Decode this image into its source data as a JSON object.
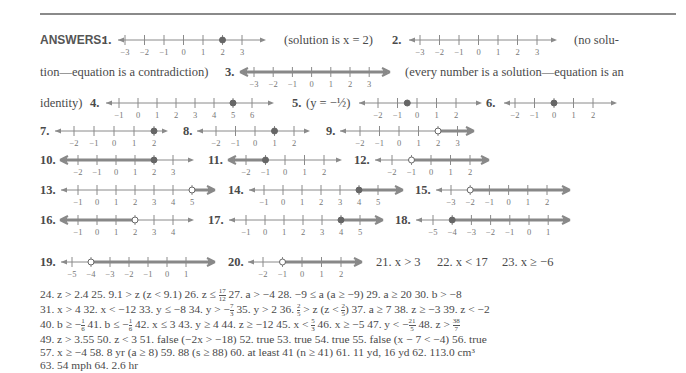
{
  "header": {
    "label": "ANSWERS:"
  },
  "colors": {
    "text": "#4a4a4a",
    "axis": "#8a8a8a",
    "shade": "#888888",
    "point": "#666666"
  },
  "prose": {
    "a1": "(solution is x = 2)",
    "a2_start": "(no solu-",
    "a2_end": "tion—equation is a contradiction)",
    "a3_start": "(every number is a solution—equation is an",
    "a3_end": "identity)",
    "a5": "(y = −½)"
  },
  "number_lines": [
    {
      "n": "1.",
      "ticks": [
        -3,
        -2,
        -1,
        0,
        1,
        2,
        3
      ],
      "point": 2,
      "closed": true,
      "shade": "none"
    },
    {
      "n": "2.",
      "ticks": [
        -3,
        -2,
        -1,
        0,
        1,
        2,
        3
      ],
      "point": null,
      "closed": false,
      "shade": "none"
    },
    {
      "n": "3.",
      "ticks": [
        -3,
        -2,
        -1,
        0,
        1,
        2,
        3
      ],
      "point": null,
      "closed": false,
      "shade": "all"
    },
    {
      "n": "4.",
      "ticks": [
        -1,
        0,
        1,
        2,
        3,
        4,
        5,
        6
      ],
      "point": 5,
      "closed": true,
      "shade": "none"
    },
    {
      "n": "5.",
      "ticks": [
        -2,
        -1,
        0,
        1,
        2
      ],
      "point": -0.5,
      "closed": true,
      "shade": "none"
    },
    {
      "n": "6.",
      "ticks": [
        -2,
        -1,
        0,
        1,
        2
      ],
      "point": 0,
      "closed": true,
      "shade": "none"
    },
    {
      "n": "7.",
      "ticks": [
        -2,
        -1,
        0,
        1,
        2
      ],
      "point": 2,
      "closed": true,
      "shade": "none"
    },
    {
      "n": "8.",
      "ticks": [
        -2,
        -1,
        0,
        1,
        2
      ],
      "point": 1,
      "closed": true,
      "shade": "none"
    },
    {
      "n": "9.",
      "ticks": [
        -2,
        -1,
        0,
        1,
        2,
        3
      ],
      "point": 2,
      "closed": false,
      "shade": "right"
    },
    {
      "n": "10.",
      "ticks": [
        -2,
        -1,
        0,
        1,
        2,
        3
      ],
      "point": 2,
      "closed": true,
      "shade": "left"
    },
    {
      "n": "11.",
      "ticks": [
        -2,
        -1,
        0,
        1,
        2
      ],
      "point": -1,
      "closed": true,
      "shade": "left"
    },
    {
      "n": "12.",
      "ticks": [
        -2,
        -1,
        0,
        1,
        2
      ],
      "point": -1,
      "closed": false,
      "shade": "right"
    },
    {
      "n": "13.",
      "ticks": [
        -1,
        0,
        1,
        2,
        3,
        4,
        5
      ],
      "point": 5,
      "closed": false,
      "shade": "right"
    },
    {
      "n": "14.",
      "ticks": [
        -1,
        0,
        1,
        2,
        3,
        4,
        5
      ],
      "point": 4,
      "closed": true,
      "shade": "right"
    },
    {
      "n": "15.",
      "ticks": [
        -3,
        -2,
        -1,
        0,
        1,
        2
      ],
      "point": -2,
      "closed": false,
      "shade": "right"
    },
    {
      "n": "16.",
      "ticks": [
        -1,
        0,
        1,
        2,
        3,
        4
      ],
      "point": 2,
      "closed": false,
      "shade": "left"
    },
    {
      "n": "17.",
      "ticks": [
        -1,
        0,
        1,
        2,
        3,
        4,
        5
      ],
      "point": 4,
      "closed": true,
      "shade": "right"
    },
    {
      "n": "18.",
      "ticks": [
        -5,
        -4,
        -3,
        -2,
        -1,
        0,
        1
      ],
      "point": -4,
      "closed": true,
      "shade": "right"
    },
    {
      "n": "19.",
      "ticks": [
        -5,
        -4,
        -3,
        -2,
        -1,
        0,
        1
      ],
      "point": -4,
      "closed": false,
      "shade": "right"
    },
    {
      "n": "20.",
      "ticks": [
        -2,
        -1,
        0,
        1,
        2
      ],
      "point": -1,
      "closed": false,
      "shade": "right"
    }
  ],
  "inline_answers_row": {
    "a21": "21. x > 3",
    "a22": "22. x < 17",
    "a23": "23. x ≥ −6"
  },
  "answer_lines": [
    "24. z > 2.4   25. 9.1 > z (z < 9.1)   26. z ≤ 17/12   27. a > −4   28. −9 ≤ a (a ≥ −9)   29. a ≥ 20   30. b > −8",
    "31. x > 4   32. x < −12   33. y ≤ −8   34. y > −7/3   35. y > 2   36. 2/5 > z (z < 2/5)   37. a ≥ 7   38. z ≥ −3   39. z < −2",
    "40. b ≥ −1/6   41. b ≤ −1/6   42. x ≤ 3   43. y ≥ 4   44. z ≥ −12   45. x < 5/3   46. x ≥ −5   47. y < −21/5   48. z > 38/7",
    "49. z > 3.55   50. z < 3   51. false (−2x > −18)   52. true   53. true   54. true   55. false (x − 7 < −4)   56. true",
    "57. x ≥ −4   58. 8 yr (a ≥ 8)   59. 88 (s ≥ 88)   60. at least 41 (n ≥ 41)   61. 11 yd, 16 yd   62. 113.0 cm³",
    "63. 54 mph   64. 2.6 hr"
  ],
  "answer_segments": {
    "l24": [
      "24. ",
      "z > 2.4",
      "25. ",
      "9.1 > z (z < 9.1)",
      "26. ",
      "z ≤ ",
      "17",
      "12",
      "27. ",
      "a > −4",
      "28. ",
      "−9 ≤ a (a ≥ −9)",
      "29. ",
      "a ≥ 20",
      "30. ",
      "b > −8"
    ],
    "l31_pre": "31. x > 4   32. x < −12   33. y ≤ −8   34. y > −",
    "l31_f1": [
      "7",
      "3"
    ],
    "l31_mid": "   35. y > 2   36. ",
    "l31_f2": [
      "2",
      "5"
    ],
    "l31_mid2": " > z (z < ",
    "l31_f3": [
      "2",
      "5"
    ],
    "l31_post": ")   37. a ≥ 7   38. z ≥ −3   39. z < −2",
    "l40_a": "40. b ≥ −",
    "l40_f1": [
      "1",
      "6"
    ],
    "l40_b": "   41. b ≤ −",
    "l40_f2": [
      "1",
      "6"
    ],
    "l40_c": "   42. x ≤ 3   43. y ≥ 4   44. z ≥ −12   45. x < ",
    "l40_f3": [
      "5",
      "3"
    ],
    "l40_d": "   46. x ≥ −5   47. y < −",
    "l40_f4": [
      "21",
      "5"
    ],
    "l40_e": "   48. z > ",
    "l40_f5": [
      "38",
      "7"
    ],
    "l49": "49. z > 3.55   50. z < 3   51. false (−2x > −18)   52. true   53. true   54. true   55. false (x − 7 < −4)   56. true",
    "l57": "57. x ≥ −4   58. 8 yr (a ≥ 8)   59. 88 (s ≥ 88)   60. at least 41 (n ≥ 41)   61. 11 yd, 16 yd   62. 113.0 cm³",
    "l63": "63. 54 mph   64. 2.6 hr",
    "l24_full": "24. z > 2.4   25. 9.1 > z (z < 9.1)   26. z ≤ ",
    "l24_f": [
      "17",
      "12"
    ],
    "l24_rest": "   27. a > −4   28. −9 ≤ a (a ≥ −9)   29. a ≥ 20   30. b > −8"
  }
}
